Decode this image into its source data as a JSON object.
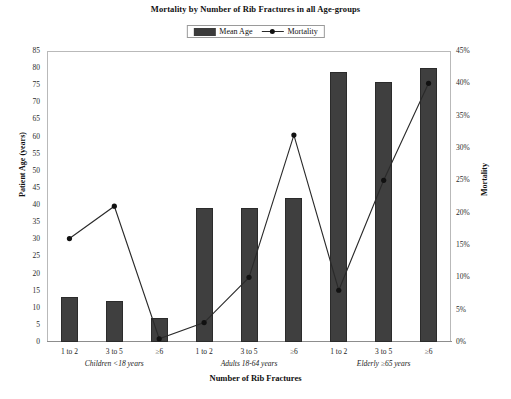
{
  "chart_data": {
    "type": "bar",
    "title": "Mortality by Number of Rib Fractures in all Age-groups",
    "xlabel": "Number of Rib Fractures",
    "ylabel": "Patient Age (years)",
    "y2label": "Mortality",
    "ylim": [
      0,
      85
    ],
    "y2lim": [
      0,
      45
    ],
    "grid": false,
    "legend_position": "top-center",
    "categories": [
      "1 to 2",
      "3 to 5",
      "≥6",
      "1 to 2",
      "3 to 5",
      "≥6",
      "1 to 2",
      "3 to 5",
      "≥6"
    ],
    "groups": [
      {
        "label": "Children <18 years",
        "categories": [
          "1 to 2",
          "3 to 5",
          "≥6"
        ]
      },
      {
        "label": "Adults 18-64 years",
        "categories": [
          "1 to 2",
          "3 to 5",
          "≥6"
        ]
      },
      {
        "label": "Elderly ≥65 years",
        "categories": [
          "1 to 2",
          "3 to 5",
          "≥6"
        ]
      }
    ],
    "series": [
      {
        "name": "Mean Age",
        "type": "bar",
        "axis": "left",
        "unit": "years",
        "color": "#3f3f3f",
        "values": [
          13,
          12,
          7,
          39,
          39,
          42,
          79,
          76,
          80
        ]
      },
      {
        "name": "Mortality",
        "type": "line",
        "axis": "right",
        "unit": "%",
        "color": "#2a2a2a",
        "marker": "circle",
        "values": [
          16,
          21,
          0.5,
          3,
          10,
          32,
          8,
          25,
          40
        ]
      }
    ],
    "yticks": [
      0,
      5,
      10,
      15,
      20,
      25,
      30,
      35,
      40,
      45,
      50,
      55,
      60,
      65,
      70,
      75,
      80,
      85
    ],
    "y2ticks": [
      "0%",
      "5%",
      "10%",
      "15%",
      "20%",
      "25%",
      "30%",
      "35%",
      "40%",
      "45%"
    ]
  },
  "legend": {
    "items": [
      {
        "label": "Mean Age",
        "marker": "swatch"
      },
      {
        "label": "Mortality",
        "marker": "line-point"
      }
    ]
  }
}
